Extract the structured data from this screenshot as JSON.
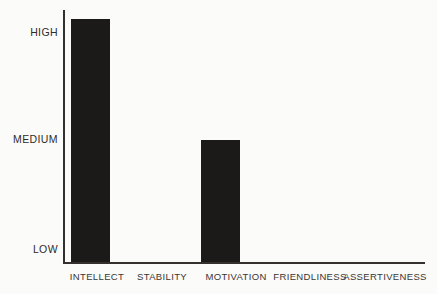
{
  "chart_data": {
    "type": "bar",
    "title": "",
    "subtitle": "",
    "xlabel": "",
    "ylabel": "",
    "categories": [
      "INTELLECT",
      "STABILITY",
      "MOTIVATION",
      "FRIENDLINESS",
      "ASSERTIVENESS"
    ],
    "values": [
      3.15,
      0,
      1.5,
      0,
      0
    ],
    "value_labels": [
      "ABOVE HIGH",
      "LOW",
      "MEDIUM",
      "LOW",
      "LOW"
    ],
    "ytick_labels": [
      "LOW",
      "MEDIUM",
      "HIGH"
    ],
    "ytick_values": [
      0,
      1.5,
      3
    ],
    "ylim": [
      0,
      3.5
    ],
    "grid": false,
    "legend": null,
    "bar_color": "#1c1a18",
    "axis_color": "#34302e",
    "background_color": "#fbfbfa",
    "series": [
      {
        "name": "",
        "values": [
          3.15,
          0,
          1.5,
          0,
          0
        ]
      }
    ]
  },
  "axis": {
    "y_labels": {
      "high": "HIGH",
      "medium": "MEDIUM",
      "low": "LOW"
    },
    "x_labels": {
      "intellect": "INTELLECT",
      "stability": "STABILITY",
      "motivation": "MOTIVATION",
      "friendliness": "FRIENDLINESS",
      "assertiveness": "ASSERTIVENESS"
    }
  }
}
